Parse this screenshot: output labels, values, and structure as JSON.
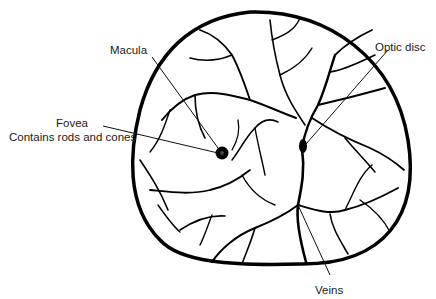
{
  "diagram": {
    "labels": {
      "macula": "Macula",
      "optic_disc": "Optic disc",
      "fovea": "Fovea",
      "fovea_note": "Contains rods and cones",
      "veins": "Veins"
    },
    "colors": {
      "line": "#000000",
      "text": "#1a1a1a",
      "background": "#ffffff"
    }
  }
}
